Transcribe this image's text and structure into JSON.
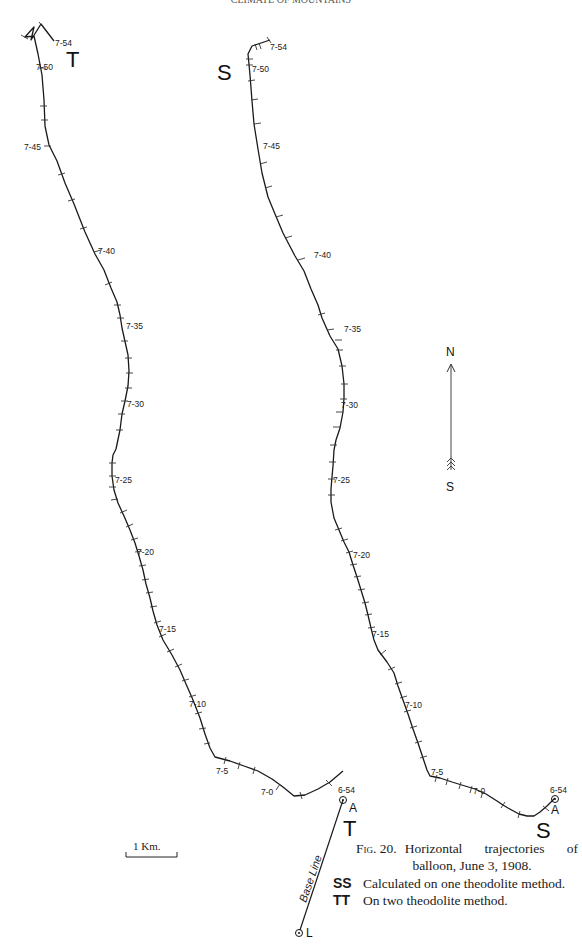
{
  "header": {
    "text": "CLIMATE OF MOUNTAINS"
  },
  "figure": {
    "number_label": "Fig. 20.",
    "caption_line1": "Horizontal trajectories of",
    "caption_line2": "balloon, June 3, 1908.",
    "legend": [
      {
        "key": "SS",
        "text": "Calculated on one theodolite method."
      },
      {
        "key": "TT",
        "text": "On two theodolite method."
      }
    ]
  },
  "trajectories": {
    "T": {
      "label": "T",
      "method": "two theodolite",
      "start_label": "6-54",
      "start_point": "A",
      "time_labels": [
        "7-54",
        "7-50",
        "7-45",
        "7-40",
        "7-35",
        "7-30",
        "7-25",
        "7-20",
        "7-15",
        "7-10",
        "7-5",
        "7-0",
        "6-54"
      ]
    },
    "S": {
      "label": "S",
      "method": "one theodolite",
      "start_label": "6-54",
      "start_point": "A",
      "time_labels": [
        "7-54",
        "7-50",
        "7-45",
        "7-40",
        "7-35",
        "7-30",
        "7-25",
        "7-20",
        "7-15",
        "7-10",
        "7-5",
        "7-0",
        "6-54"
      ]
    }
  },
  "baseline": {
    "label": "Base Line",
    "end_point": "L",
    "start_point": "A"
  },
  "compass": {
    "north": "N",
    "south": "S"
  },
  "scale": {
    "label": "1 Km."
  }
}
